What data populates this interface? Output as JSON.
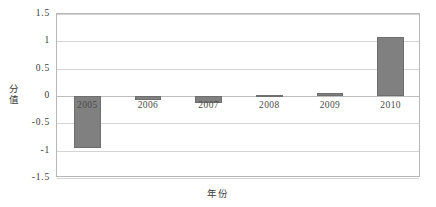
{
  "chart_data": {
    "type": "bar",
    "title": "",
    "xlabel": "年份",
    "ylabel": "分值",
    "categories": [
      "2005",
      "2006",
      "2007",
      "2008",
      "2009",
      "2010"
    ],
    "values": [
      -0.95,
      -0.07,
      -0.13,
      0.02,
      0.06,
      1.08
    ],
    "series": [
      {
        "name": "分值",
        "values": [
          -0.95,
          -0.07,
          -0.13,
          0.02,
          0.06,
          1.08
        ]
      }
    ],
    "ylim": [
      -1.5,
      1.5
    ],
    "yticks": [
      1.5,
      1,
      0.5,
      0,
      -0.5,
      -1,
      -1.5
    ],
    "ytick_labels": [
      "1.5",
      "1",
      "0.5",
      "0",
      "-0.5",
      "-1",
      "-1.5"
    ],
    "grid": true,
    "legend": false,
    "bar_color": "#808080",
    "bar_border_color": "#6e6e6e",
    "gridline_color": "#d4d4d4",
    "frame_color": "#b6b6b6",
    "background": "#ffffff"
  }
}
